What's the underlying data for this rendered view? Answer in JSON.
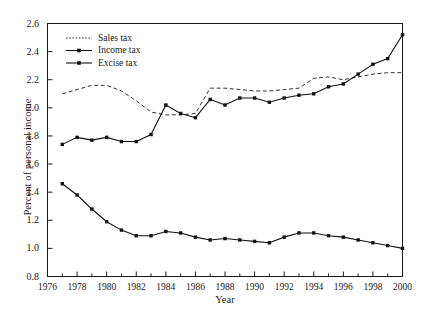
{
  "chart_data": {
    "type": "line",
    "title": "",
    "xlabel": "Year",
    "ylabel": "Percent of personal income",
    "xlim": [
      1976,
      2000
    ],
    "ylim": [
      0.8,
      2.6
    ],
    "ytick_labels": [
      "0.8",
      "1.0",
      "1.2",
      "1.4",
      "1.6",
      "1.8",
      "2.0",
      "2.2",
      "2.4",
      "2.6"
    ],
    "ytick_values": [
      0.8,
      1.0,
      1.2,
      1.4,
      1.6,
      1.8,
      2.0,
      2.2,
      2.4,
      2.6
    ],
    "xtick_labels": [
      "1976",
      "1978",
      "1980",
      "1982",
      "1984",
      "1986",
      "1988",
      "1990",
      "1992",
      "1994",
      "1996",
      "1998",
      "2000"
    ],
    "xtick_values": [
      1976,
      1978,
      1980,
      1982,
      1984,
      1986,
      1988,
      1990,
      1992,
      1994,
      1996,
      1998,
      2000
    ],
    "minor_xticks": [
      1977,
      1979,
      1981,
      1983,
      1985,
      1987,
      1989,
      1991,
      1993,
      1995,
      1997,
      1999
    ],
    "grid": false,
    "legend_position": "upper-left",
    "x": [
      1977,
      1978,
      1979,
      1980,
      1981,
      1982,
      1983,
      1984,
      1985,
      1986,
      1987,
      1988,
      1989,
      1990,
      1991,
      1992,
      1993,
      1994,
      1995,
      1996,
      1997,
      1998,
      1999,
      2000
    ],
    "series": [
      {
        "name": "Sales tax",
        "style": "dashed",
        "marker": "none",
        "color": "#333333",
        "values": [
          2.1,
          2.13,
          2.16,
          2.16,
          2.12,
          2.05,
          1.97,
          1.95,
          1.95,
          1.96,
          2.14,
          2.14,
          2.13,
          2.12,
          2.12,
          2.13,
          2.14,
          2.21,
          2.22,
          2.2,
          2.22,
          2.24,
          2.25,
          2.25
        ]
      },
      {
        "name": "Income tax",
        "style": "solid",
        "marker": "filled-square",
        "color": "#111111",
        "values": [
          1.74,
          1.79,
          1.77,
          1.79,
          1.76,
          1.76,
          1.81,
          2.02,
          1.96,
          1.93,
          2.06,
          2.02,
          2.07,
          2.07,
          2.04,
          2.07,
          2.09,
          2.1,
          2.15,
          2.17,
          2.24,
          2.31,
          2.35,
          2.52
        ]
      },
      {
        "name": "Excise tax",
        "style": "solid",
        "marker": "filled-square",
        "color": "#111111",
        "values": [
          1.46,
          1.38,
          1.28,
          1.19,
          1.13,
          1.09,
          1.09,
          1.12,
          1.11,
          1.08,
          1.06,
          1.07,
          1.06,
          1.05,
          1.04,
          1.08,
          1.11,
          1.11,
          1.09,
          1.08,
          1.06,
          1.04,
          1.02,
          1.0
        ]
      }
    ]
  },
  "legend": {
    "items": [
      {
        "label": "Sales tax"
      },
      {
        "label": "Income tax"
      },
      {
        "label": "Excise tax"
      }
    ]
  }
}
